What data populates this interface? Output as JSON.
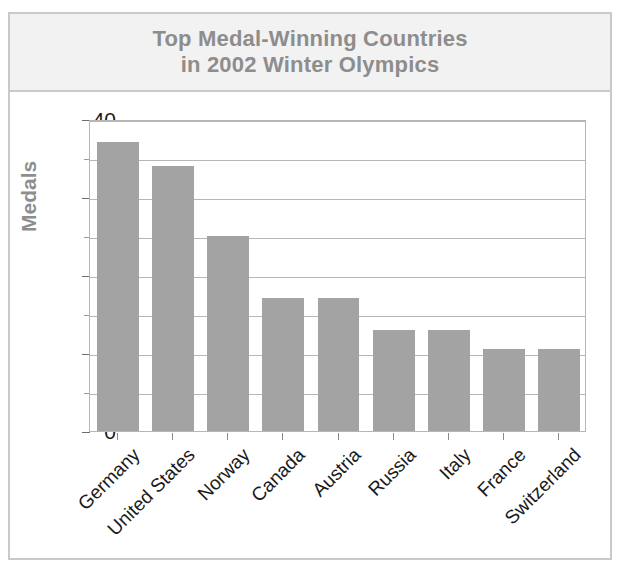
{
  "figure": {
    "title_lines": [
      "Top Medal-Winning Countries",
      "in 2002 Winter Olympics"
    ],
    "title_color": "#8d8d8d",
    "bar_color": "#a3a3a3",
    "grid_color": "#b6b6b6",
    "frame_color": "#c9c9c9",
    "header_background": "#f2f2f2"
  },
  "chart_data": {
    "type": "bar",
    "title": "Top Medal-Winning Countries in 2002 Winter Olympics",
    "xlabel": "",
    "ylabel": "Medals",
    "ylim": [
      0,
      40
    ],
    "grid": true,
    "legend": "none",
    "categories": [
      "Germany",
      "United States",
      "Norway",
      "Canada",
      "Austria",
      "Russia",
      "Italy",
      "France",
      "Switzerland"
    ],
    "values": [
      37,
      34,
      25,
      17,
      17,
      13,
      13,
      10.5,
      10.5
    ],
    "ytick_labels": [
      "0",
      "10",
      "20",
      "30",
      "40"
    ],
    "ytick_values": [
      0,
      10,
      20,
      30,
      40
    ],
    "yminor_values": [
      5,
      15,
      25,
      35
    ],
    "gridline_values": [
      5,
      10,
      15,
      20,
      25,
      30,
      35,
      40
    ]
  }
}
